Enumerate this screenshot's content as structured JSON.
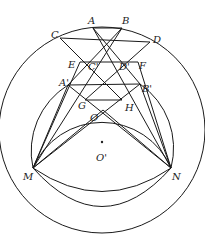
{
  "diagram": {
    "labels": {
      "A": "A",
      "B": "B",
      "C": "C",
      "D": "D",
      "E": "E",
      "F": "F",
      "Cp": "C'",
      "Dp": "D'",
      "Ap": "A'",
      "Bp": "B'",
      "G": "G",
      "H": "H",
      "O": "O",
      "Op": "O'",
      "M": "M",
      "N": "N"
    }
  }
}
